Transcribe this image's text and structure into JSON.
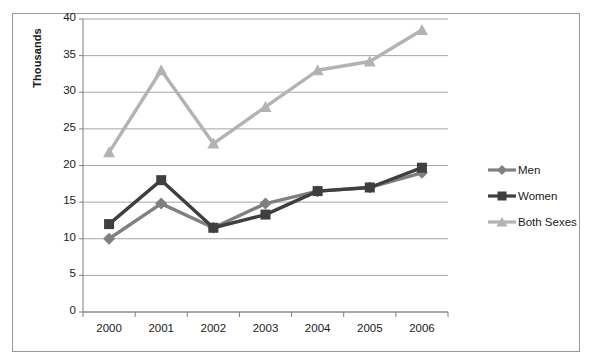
{
  "chart_data": {
    "type": "line",
    "title": "",
    "xlabel": "",
    "ylabel": "Thousands",
    "categories": [
      "2000",
      "2001",
      "2002",
      "2003",
      "2004",
      "2005",
      "2006"
    ],
    "ylim": [
      0,
      40
    ],
    "ytick_step": 5,
    "yticks": [
      "0",
      "5",
      "10",
      "15",
      "20",
      "25",
      "30",
      "35",
      "40"
    ],
    "grid": "horizontal",
    "legend_position": "right",
    "series": [
      {
        "name": "Men",
        "marker": "diamond",
        "color": "#808080",
        "values": [
          10.0,
          14.8,
          11.5,
          14.8,
          16.5,
          17.0,
          19.0
        ]
      },
      {
        "name": "Women",
        "marker": "square",
        "color": "#3f3f3f",
        "values": [
          12.0,
          18.0,
          11.5,
          13.3,
          16.5,
          17.0,
          19.7
        ]
      },
      {
        "name": "Both Sexes",
        "marker": "triangle",
        "color": "#b3b3b3",
        "values": [
          21.8,
          33.0,
          23.0,
          28.0,
          33.0,
          34.2,
          38.5
        ]
      }
    ]
  },
  "axis": {
    "y_title": "Thousands"
  },
  "legend": {
    "items": [
      {
        "label": "Men"
      },
      {
        "label": "Women"
      },
      {
        "label": "Both Sexes"
      }
    ]
  },
  "colors": {
    "men": "#808080",
    "women": "#3f3f3f",
    "both_sexes": "#b3b3b3",
    "gridline": "#a6a6a6",
    "axis": "#7f7f7f",
    "border": "#9a9a9a",
    "text": "#1a1a1a"
  }
}
